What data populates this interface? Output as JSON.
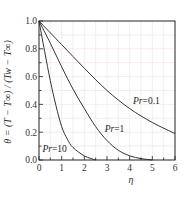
{
  "chart_data": {
    "type": "line",
    "title": "",
    "xlabel": "η",
    "ylabel": "θ = (T − T∞) / (Tw − T∞)",
    "xlim": [
      0,
      6
    ],
    "ylim": [
      0.0,
      1.0
    ],
    "x_ticks": [
      "0",
      "1",
      "2",
      "3",
      "4",
      "5",
      "6"
    ],
    "y_ticks": [
      "0.0",
      "0.2",
      "0.4",
      "0.6",
      "0.8",
      "1.0"
    ],
    "grid": true,
    "legend_position": "inline labels",
    "series": [
      {
        "name": "Pr=0.1",
        "label_pos": [
          4.15,
          0.4
        ],
        "x": [
          0,
          1,
          2,
          3,
          4,
          5,
          6
        ],
        "values": [
          1.0,
          0.83,
          0.66,
          0.5,
          0.37,
          0.27,
          0.19
        ]
      },
      {
        "name": "Pr=1",
        "label_pos": [
          2.9,
          0.2
        ],
        "x": [
          0,
          0.5,
          1,
          1.5,
          2,
          2.5,
          3,
          3.5,
          4,
          4.5,
          5
        ],
        "values": [
          1.0,
          0.84,
          0.67,
          0.51,
          0.37,
          0.24,
          0.14,
          0.07,
          0.03,
          0.01,
          0.0
        ]
      },
      {
        "name": "Pr=10",
        "label_pos": [
          0.15,
          0.06
        ],
        "x": [
          0,
          0.25,
          0.5,
          0.75,
          1.0,
          1.25,
          1.5,
          2.0,
          2.5
        ],
        "values": [
          1.0,
          0.78,
          0.57,
          0.39,
          0.24,
          0.15,
          0.09,
          0.03,
          0.0
        ]
      }
    ]
  },
  "labels": {
    "xlabel": "η",
    "ylabel": "θ = (T − T∞) / (Tw − T∞)",
    "series_prefix": "Pr",
    "series_values": [
      "=0.1",
      "=1",
      "=10"
    ]
  },
  "colors": {
    "curve": "#333333",
    "axis": "#222222",
    "grid_vertical": "#e6e6e6",
    "grid_horizontal": "#f3dede"
  }
}
